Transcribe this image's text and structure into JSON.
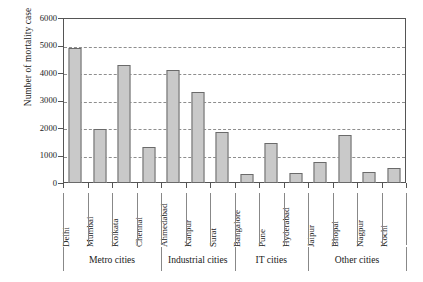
{
  "chart_data": {
    "type": "bar",
    "title": "",
    "xlabel": "",
    "ylabel": "Number of  mortality case",
    "ylim": [
      0,
      6000
    ],
    "ytick_values": [
      0,
      1000,
      2000,
      3000,
      4000,
      5000,
      6000
    ],
    "ytick_labels": [
      "0",
      "1000",
      "2000",
      "3000",
      "4000",
      "5000",
      "6000"
    ],
    "grid": "horizontal-dashed",
    "legend": "none",
    "bar_color": "#c9c9c9",
    "bar_edge_color": "#6a6a6a",
    "categories": [
      "Delhi",
      "Mumbai",
      "Kolkata",
      "Chennai",
      "Ahmedabad",
      "Kanpur",
      "Surat",
      "Bangalore",
      "Pune",
      "Hyderabad",
      "Jaipur",
      "Bhopal",
      "Nagpur",
      "Kochi"
    ],
    "values": [
      4900,
      1950,
      4300,
      1300,
      4100,
      3300,
      1850,
      330,
      1450,
      350,
      750,
      1750,
      400,
      550
    ],
    "groups": [
      {
        "label": "Metro cities",
        "count": 4
      },
      {
        "label": "Industrial cities",
        "count": 3
      },
      {
        "label": "IT cities",
        "count": 3
      },
      {
        "label": "Other cities",
        "count": 4
      }
    ]
  }
}
